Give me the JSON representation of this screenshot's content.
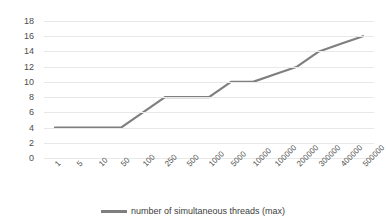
{
  "chart_data": {
    "type": "line",
    "title": "",
    "subtitle": "",
    "xlabel": "",
    "ylabel": "",
    "categories": [
      "1",
      "5",
      "10",
      "50",
      "100",
      "250",
      "500",
      "1000",
      "5000",
      "10000",
      "100000",
      "200000",
      "300000",
      "400000",
      "500000"
    ],
    "series": [
      {
        "name": "number of simultaneous threads (max)",
        "color": "#7f7f7f",
        "values": [
          4,
          4,
          4,
          4,
          6,
          8,
          8,
          8,
          10,
          10,
          11,
          12,
          14,
          15,
          16
        ]
      }
    ],
    "ylim": [
      0,
      18
    ],
    "ytick_labels": [
      "0",
      "2",
      "4",
      "6",
      "8",
      "10",
      "12",
      "14",
      "16",
      "18"
    ],
    "ytick_values": [
      0,
      2,
      4,
      6,
      8,
      10,
      12,
      14,
      16,
      18
    ],
    "grid": true,
    "grid_axis": "y",
    "grid_color": "#e8e8e8",
    "legend_position": "bottom",
    "plot_background": "#ffffff",
    "xtick_rotation": -45
  },
  "legend": {
    "entries": [
      {
        "label": "number of simultaneous threads (max)",
        "color": "#7f7f7f"
      }
    ]
  }
}
